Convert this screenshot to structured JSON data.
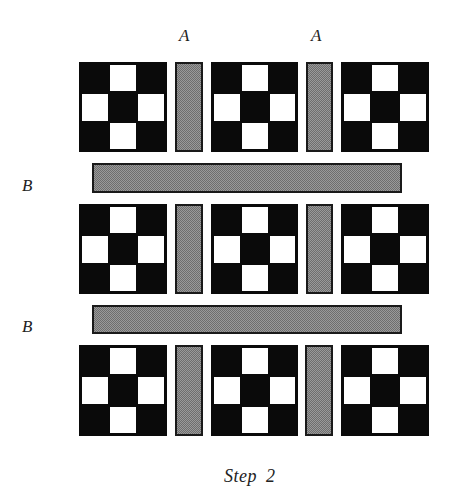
{
  "diagram": {
    "caption": "Step 2",
    "column_labels": [
      {
        "text": "A",
        "x": 179,
        "y": 28
      },
      {
        "text": "A",
        "x": 311,
        "y": 28
      }
    ],
    "row_labels": [
      {
        "text": "B",
        "x": 22,
        "y": 177
      },
      {
        "text": "B",
        "x": 22,
        "y": 318
      }
    ],
    "colors": {
      "block_dark": "#0a0a0a",
      "block_light": "#ffffff",
      "sashing_fill": "#9a9a9a",
      "sashing_border": "#1a1a1a"
    },
    "block_pattern": {
      "grid": "3x3",
      "white_cells": [
        "top-center",
        "middle-left",
        "middle-right",
        "bottom-center"
      ],
      "black_cells": [
        "top-left",
        "top-right",
        "center",
        "bottom-left",
        "bottom-right"
      ]
    },
    "rows": [
      {
        "index": 1,
        "blocks": 3,
        "vertical_sashing": [
          "A",
          "A"
        ]
      },
      {
        "index": 2,
        "blocks": 3,
        "vertical_sashing": [
          "A",
          "A"
        ]
      },
      {
        "index": 3,
        "blocks": 3,
        "vertical_sashing": [
          "A",
          "A"
        ]
      }
    ],
    "horizontal_sashing": [
      "B",
      "B"
    ]
  }
}
